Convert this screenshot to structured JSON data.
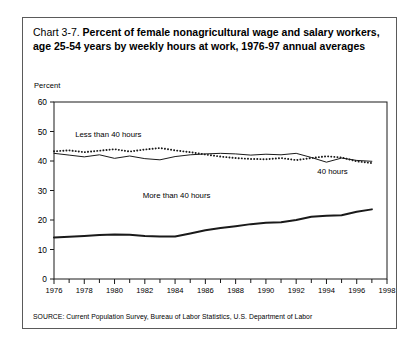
{
  "figure": {
    "title_lead": "Chart 3-7.",
    "title_bold": "Percent of female nonagricultural wage and salary workers, age 25-54 years by weekly hours at work, 1976-97 annual averages",
    "y_axis_title": "Percent",
    "source": "SOURCE: Current Population Survey, Bureau of Labor Statistics, U.S. Department of Labor"
  },
  "chart_data": {
    "type": "line",
    "title": "Percent of female nonagricultural wage and salary workers, age 25-54 years by weekly hours at work, 1976-97 annual averages",
    "xlabel": "",
    "ylabel": "Percent",
    "xlim": [
      1976,
      1998
    ],
    "ylim": [
      0,
      60
    ],
    "yticks": [
      0,
      10,
      20,
      30,
      40,
      50,
      60
    ],
    "xticks": [
      1976,
      1978,
      1980,
      1982,
      1984,
      1986,
      1988,
      1990,
      1992,
      1994,
      1996,
      1998
    ],
    "xticks_minor_step": 1,
    "grid": false,
    "legend": "inline-annotations",
    "x": [
      1976,
      1977,
      1978,
      1979,
      1980,
      1981,
      1982,
      1983,
      1984,
      1985,
      1986,
      1987,
      1988,
      1989,
      1990,
      1991,
      1992,
      1993,
      1994,
      1995,
      1996,
      1997
    ],
    "series": [
      {
        "name": "Less than 40 hours",
        "style": "dotted",
        "label": "Less than 40 hours",
        "label_x": 1977.4,
        "label_y": 48.2,
        "values": [
          43.3,
          43.6,
          43.0,
          43.5,
          44.0,
          43.2,
          43.9,
          44.4,
          43.6,
          43.0,
          42.2,
          41.5,
          41.0,
          40.7,
          40.6,
          41.0,
          40.3,
          41.0,
          41.6,
          41.2,
          39.9,
          39.3
        ]
      },
      {
        "name": "40 hours",
        "style": "solid-thin",
        "label": "40 hours",
        "label_x": 1993.4,
        "label_y": 35.6,
        "values": [
          42.6,
          42.0,
          41.4,
          42.1,
          40.9,
          41.7,
          40.8,
          40.4,
          41.5,
          42.1,
          42.4,
          42.6,
          42.4,
          42.0,
          42.3,
          42.1,
          42.6,
          41.2,
          39.6,
          41.0,
          40.2,
          39.9
        ]
      },
      {
        "name": "More than 40 hours",
        "style": "solid-thick",
        "label": "More than 40 hours",
        "label_x": 1984.1,
        "label_y": 27.6,
        "values": [
          14.1,
          14.3,
          14.6,
          14.9,
          15.1,
          15.0,
          14.6,
          14.4,
          14.4,
          15.4,
          16.5,
          17.3,
          17.9,
          18.6,
          19.1,
          19.2,
          20.0,
          21.1,
          21.4,
          21.6,
          22.8,
          23.6
        ]
      }
    ]
  }
}
